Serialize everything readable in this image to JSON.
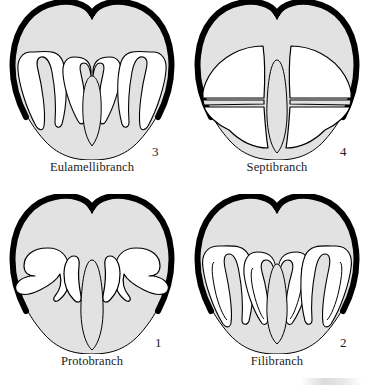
{
  "figure": {
    "background_color": "#ffffff",
    "shell_outline_color": "#000000",
    "visceral_fill_color": "#e2e2e2",
    "mantle_cavity_color": "#ffffff",
    "label_text_color": "#1c1c1c"
  },
  "panels": [
    {
      "id": "eulamellibranch",
      "position": "top-left",
      "label": "Eulamellibranch",
      "number": "3",
      "description": "Gill filaments fused into sheets forming W-shaped lamellae with broad demibranchs"
    },
    {
      "id": "septibranch",
      "position": "top-right",
      "label": "Septibranch",
      "number": "4",
      "description": "Gill reduced to a muscular horizontal septum dividing the mantle cavity"
    },
    {
      "id": "protobranch",
      "position": "bottom-left",
      "label": "Protobranch",
      "number": "1",
      "description": "Simple leaf-like bipectinate gill with short flattened filaments"
    },
    {
      "id": "filibranch",
      "position": "bottom-right",
      "label": "Filibranch",
      "number": "2",
      "description": "Elongate separate filaments folded into W shapes, joined only by ciliary junctions"
    }
  ]
}
